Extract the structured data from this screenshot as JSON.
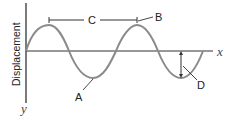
{
  "diagram": {
    "type": "transverse wave",
    "axis_labels": {
      "x": "x",
      "y": "y",
      "vertical": "Displacement"
    },
    "labels": [
      {
        "id": "A",
        "meaning": "trough"
      },
      {
        "id": "B",
        "meaning": "crest"
      },
      {
        "id": "C",
        "meaning": "wavelength (crest to crest)"
      },
      {
        "id": "D",
        "meaning": "amplitude"
      }
    ],
    "colors": {
      "wave": "#8a8a8a",
      "axes": "#333333",
      "text": "#222222"
    }
  }
}
